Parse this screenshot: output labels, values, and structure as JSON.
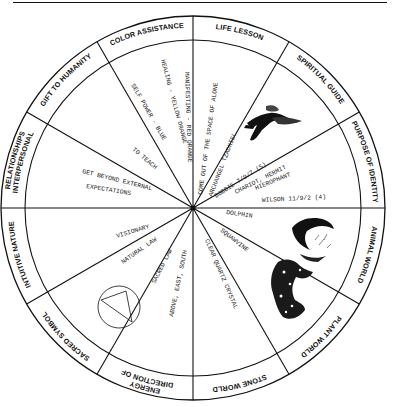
{
  "diagram": {
    "type": "medicine-wheel",
    "center": [
      193,
      208
    ],
    "outer_radius": 192,
    "inner_radius": 168,
    "line_color": "#111111",
    "background": "#ffffff"
  },
  "sectors": [
    {
      "id": "life-lesson",
      "label": "LIFE LESSON",
      "start": 0,
      "end": 30,
      "entries": [
        "COME OUT OF THE SPACE OF ALONE"
      ]
    },
    {
      "id": "spiritual-guide",
      "label": "SPIRITUAL GUIDE",
      "start": 30,
      "end": 60,
      "entries": [
        "ARCHANGEL TZADKIEL"
      ],
      "image": "angel-illustration"
    },
    {
      "id": "purpose-of-identity",
      "label": "PURPOSE OF IDENTITY",
      "start": 60,
      "end": 90,
      "entries": [
        "BOBBIE 7/9/7 (5)",
        "CHARIOT, HERMIT",
        "HIEROPHANT",
        "WILSON 11/9/2 (4)"
      ]
    },
    {
      "id": "animal-world",
      "label": "ANIMAL WORLD",
      "start": 90,
      "end": 120,
      "entries": [
        "DOLPHIN"
      ],
      "image": "dolphin-illustration"
    },
    {
      "id": "plant-world",
      "label": "PLANT WORLD",
      "start": 120,
      "end": 150,
      "entries": [
        "SQUAWVINE"
      ],
      "image": "plant-illustration"
    },
    {
      "id": "stone-world",
      "label": "STONE WORLD",
      "start": 150,
      "end": 180,
      "entries": [
        "CLEAR QUARTZ CRYSTAL"
      ]
    },
    {
      "id": "direction-of-energy",
      "label": "DIRECTION OF ENERGY",
      "label_lines": [
        "DIRECTION OF",
        "ENERGY"
      ],
      "start": 180,
      "end": 210,
      "entries": [
        "ABOVE, EAST, SOUTH"
      ]
    },
    {
      "id": "sacred-symbol",
      "label": "SACRED SYMBOL",
      "start": 210,
      "end": 240,
      "entries": [
        "SACRED LAW"
      ],
      "image": "triangle-in-circle"
    },
    {
      "id": "intuitive-nature",
      "label": "INTUITIVE NATURE",
      "start": 240,
      "end": 270,
      "entries": [
        "NATURAL LAW",
        "VISIONARY"
      ]
    },
    {
      "id": "interpersonal-relationships",
      "label": "INTERPERSONAL RELATIONSHIPS",
      "label_lines": [
        "INTERPERSONAL",
        "RELATIONSHIPS"
      ],
      "start": 270,
      "end": 300,
      "entries": [
        "GET BEYOND EXTERNAL",
        "EXPECTATIONS"
      ]
    },
    {
      "id": "gift-to-humanity",
      "label": "GIFT TO HUMANITY",
      "start": 300,
      "end": 330,
      "entries": [
        "TO TEACH"
      ]
    },
    {
      "id": "color-assistance",
      "label": "COLOR ASSISTANCE",
      "start": 330,
      "end": 360,
      "entries": [
        "SELF POWER - BLUE",
        "HEALING - YELLOW ORANGE",
        "MANIFESTING - RED ORANGE"
      ]
    }
  ],
  "labels": {
    "life_lesson": "LIFE LESSON",
    "spiritual_guide": "SPIRITUAL GUIDE",
    "purpose_of_identity": "PURPOSE OF IDENTITY",
    "animal_world": "ANIMAL WORLD",
    "plant_world": "PLANT WORLD",
    "stone_world": "STONE WORLD",
    "direction_line1": "DIRECTION OF",
    "direction_line2": "ENERGY",
    "sacred_symbol": "SACRED SYMBOL",
    "intuitive_nature": "INTUITIVE NATURE",
    "interpersonal_line1": "INTERPERSONAL",
    "interpersonal_line2": "RELATIONSHIPS",
    "gift_to_humanity": "GIFT TO HUMANITY",
    "color_assistance": "COLOR ASSISTANCE"
  },
  "entries": {
    "come_out": "COME OUT OF THE SPACE OF ALONE",
    "archangel": "ARCHANGEL TZADKIEL",
    "bobbie": "BOBBIE 7/9/7 (5)",
    "chariot": "CHARIOT, HERMIT",
    "hierophant": "HIEROPHANT",
    "wilson": "WILSON 11/9/2 (4)",
    "dolphin": "DOLPHIN",
    "squawvine": "SQUAWVINE",
    "quartz": "CLEAR QUARTZ CRYSTAL",
    "directions": "ABOVE, EAST, SOUTH",
    "sacred_law": "SACRED LAW",
    "natural_law": "NATURAL LAW",
    "visionary": "VISIONARY",
    "get_beyond": "GET BEYOND EXTERNAL",
    "expectations": "EXPECTATIONS",
    "to_teach": "TO TEACH",
    "self_power": "SELF POWER - BLUE",
    "healing": "HEALING - YELLOW ORANGE",
    "manifesting": "MANIFESTING - RED ORANGE"
  }
}
